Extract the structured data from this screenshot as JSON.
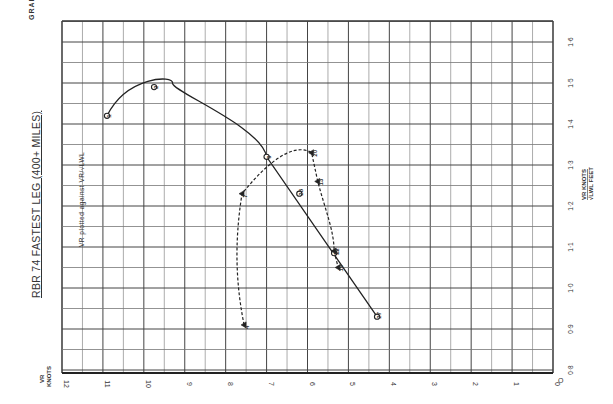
{
  "page": {
    "graph_label": "GRAPH 6",
    "title": "RBR 74  FASTEST LEG (400+ MILES)",
    "subtitle": "VR PLOTTED AGAINST √LWL",
    "subtitle_fraction": "VR / √LWL"
  },
  "chart_data": {
    "type": "scatter",
    "orientation": "rotated 90° (page turned sideways)",
    "title": "RBR 74 FASTEST LEG (400+ MILES)",
    "subtitle": "VR plotted against VR/√LWL",
    "xlabel": "VR KNOTS",
    "ylabel": "VR KNOTS / √LWL FEET",
    "x_ticks": [
      "12",
      "11",
      "10",
      "9",
      "8",
      "7",
      "6",
      "5",
      "4",
      "3",
      "2",
      "1",
      "0"
    ],
    "y_ticks": [
      "0·8",
      "0·9",
      "1·0",
      "1·1",
      "1·2",
      "1·3",
      "1·4",
      "1·5",
      "1·6"
    ],
    "xlim": [
      12,
      0
    ],
    "ylim": [
      0.8,
      1.6
    ],
    "grid": true,
    "series": [
      {
        "name": "Circle markers (solid curve/line)",
        "marker": "circle",
        "line": "solid",
        "points": [
          {
            "label": "1",
            "knots": 10.9,
            "ratio": 1.42
          },
          {
            "label": "2",
            "knots": 9.75,
            "ratio": 1.49
          },
          {
            "label": "9",
            "knots": 7.0,
            "ratio": 1.32
          },
          {
            "label": "28",
            "knots": 6.2,
            "ratio": 1.23
          },
          {
            "label": "16",
            "knots": 5.35,
            "ratio": 1.085
          },
          {
            "label": "27",
            "knots": 4.3,
            "ratio": 0.93
          }
        ]
      },
      {
        "name": "Triangle markers (dashed curve)",
        "marker": "triangle",
        "line": "dashed",
        "points": [
          {
            "label": "4",
            "knots": 7.55,
            "ratio": 0.91
          },
          {
            "label": "7",
            "knots": 7.6,
            "ratio": 1.23
          },
          {
            "label": "20",
            "knots": 5.9,
            "ratio": 1.33
          },
          {
            "label": "13",
            "knots": 5.75,
            "ratio": 1.26
          },
          {
            "label": "12",
            "knots": 5.35,
            "ratio": 1.09
          },
          {
            "label": "19",
            "knots": 5.25,
            "ratio": 1.05
          }
        ]
      }
    ]
  }
}
